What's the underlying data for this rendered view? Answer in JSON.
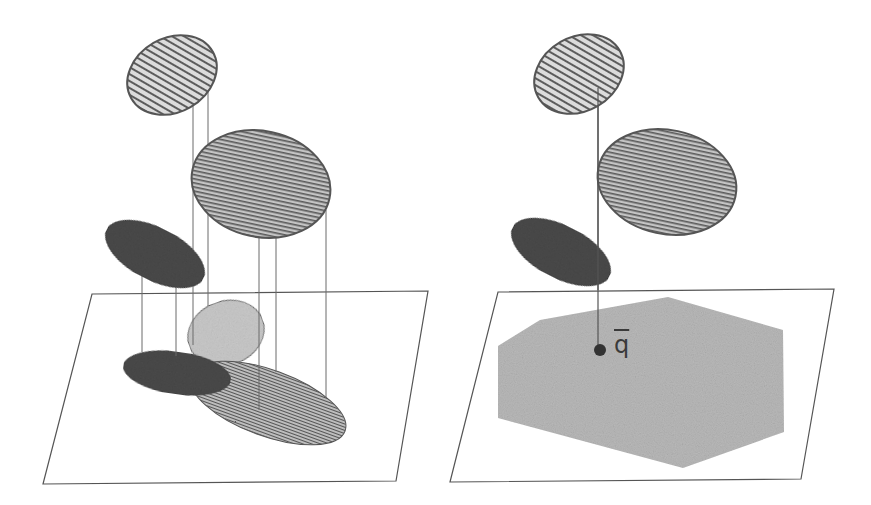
{
  "figure": {
    "panels": [
      {
        "id": "left",
        "description": "Three 3D ellipsoids projected onto a plane, producing overlapping 2D ellipses",
        "plane": {
          "corners": [
            [
              92,
              294
            ],
            [
              428,
              291
            ],
            [
              396,
              481
            ],
            [
              43,
              484
            ]
          ]
        },
        "ellipsoids": [
          {
            "name": "top-striped",
            "cx": 172,
            "cy": 75,
            "rx": 47,
            "ry": 37,
            "rotate": -30,
            "pattern": "vertical-stripes"
          },
          {
            "name": "middle-striped",
            "cx": 261,
            "cy": 184,
            "rx": 70,
            "ry": 53,
            "rotate": 12,
            "pattern": "horizontal-stripes"
          },
          {
            "name": "dark",
            "cx": 155,
            "cy": 254,
            "rx": 54,
            "ry": 26,
            "rotate": 27,
            "pattern": "solid-dark"
          }
        ],
        "projections": [
          {
            "name": "light-projection",
            "cx": 226,
            "cy": 333,
            "rx": 39,
            "ry": 32,
            "rotate": -20,
            "pattern": "light-grey"
          },
          {
            "name": "striped-projection",
            "cx": 268,
            "cy": 403,
            "rx": 82,
            "ry": 33,
            "rotate": 20,
            "pattern": "horizontal-stripes"
          },
          {
            "name": "dark-projection",
            "cx": 177,
            "cy": 373,
            "rx": 54,
            "ry": 21,
            "rotate": 8,
            "pattern": "solid-dark"
          }
        ],
        "projection_lines_x": [
          142,
          176,
          193,
          208,
          259,
          276,
          326
        ]
      },
      {
        "id": "right",
        "description": "Same ellipsoids with a single projected point q-bar inside a hexagonal region",
        "plane": {
          "corners": [
            [
              498,
              292
            ],
            [
              834,
              289
            ],
            [
              801,
              479
            ],
            [
              450,
              482
            ]
          ]
        },
        "ellipsoids": [
          {
            "name": "top-striped",
            "cx": 579,
            "cy": 74,
            "rx": 47,
            "ry": 37,
            "rotate": -30,
            "pattern": "vertical-stripes"
          },
          {
            "name": "middle-striped",
            "cx": 667,
            "cy": 182,
            "rx": 70,
            "ry": 52,
            "rotate": 12,
            "pattern": "horizontal-stripes"
          },
          {
            "name": "dark",
            "cx": 561,
            "cy": 252,
            "rx": 54,
            "ry": 26,
            "rotate": 27,
            "pattern": "solid-dark"
          }
        ],
        "hexagon": [
          [
            498,
            346
          ],
          [
            540,
            320
          ],
          [
            668,
            297
          ],
          [
            783,
            330
          ],
          [
            784,
            432
          ],
          [
            683,
            468
          ],
          [
            498,
            418
          ]
        ],
        "point": {
          "cx": 600,
          "cy": 350,
          "r": 6,
          "label": "q"
        },
        "projection_line": {
          "x": 598,
          "y1": 88,
          "y2": 350
        }
      }
    ],
    "point_label": "q",
    "colors": {
      "outline": "#555555",
      "dark_fill": "#4a4a4a",
      "light_fill": "#c8c8c8",
      "stripe": "#5a5a5a",
      "stripe_bg": "#bdbdbd",
      "hexagon_fill": "#b9b9b9",
      "plane_stroke": "#555555"
    }
  }
}
